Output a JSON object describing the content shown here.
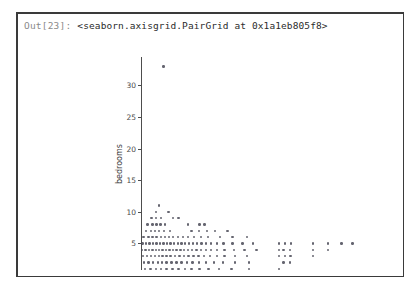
{
  "cell": {
    "prompt": "Out[23]:",
    "repr": "<seaborn.axisgrid.PairGrid at 0x1a1eb805f8>"
  },
  "chart_data": {
    "type": "scatter",
    "title": "",
    "xlabel": "",
    "ylabel": "bedrooms",
    "grid": false,
    "legend": null,
    "marker_color": "#4a4a57",
    "marker_size": 2.4,
    "xlim": [
      0,
      1.0
    ],
    "ylim": [
      0.8,
      34.5
    ],
    "yticks": [
      5,
      10,
      15,
      20,
      25,
      30
    ],
    "ytick_labels": [
      "5",
      "10",
      "15",
      "20",
      "25",
      "30"
    ],
    "xticks": [],
    "xtick_labels": [],
    "note": "x axis tick labels are cropped out of the visible figure region",
    "points": [
      [
        0.091,
        33
      ],
      [
        0.072,
        11
      ],
      [
        0.06,
        10
      ],
      [
        0.112,
        10
      ],
      [
        0.043,
        9
      ],
      [
        0.062,
        9
      ],
      [
        0.082,
        9
      ],
      [
        0.131,
        9
      ],
      [
        0.152,
        9
      ],
      [
        0.027,
        8
      ],
      [
        0.046,
        8
      ],
      [
        0.063,
        8
      ],
      [
        0.08,
        8
      ],
      [
        0.097,
        8
      ],
      [
        0.19,
        8
      ],
      [
        0.238,
        8
      ],
      [
        0.258,
        8
      ],
      [
        0.02,
        7
      ],
      [
        0.041,
        7
      ],
      [
        0.058,
        7
      ],
      [
        0.074,
        7
      ],
      [
        0.094,
        7
      ],
      [
        0.118,
        7
      ],
      [
        0.205,
        7
      ],
      [
        0.236,
        7
      ],
      [
        0.268,
        7
      ],
      [
        0.3,
        7
      ],
      [
        0.352,
        7
      ],
      [
        0.01,
        6
      ],
      [
        0.031,
        6
      ],
      [
        0.047,
        6
      ],
      [
        0.063,
        6
      ],
      [
        0.081,
        6
      ],
      [
        0.097,
        6
      ],
      [
        0.114,
        6
      ],
      [
        0.131,
        6
      ],
      [
        0.15,
        6
      ],
      [
        0.17,
        6
      ],
      [
        0.19,
        6
      ],
      [
        0.215,
        6
      ],
      [
        0.243,
        6
      ],
      [
        0.272,
        6
      ],
      [
        0.32,
        6
      ],
      [
        0.372,
        6
      ],
      [
        0.43,
        6
      ],
      [
        0.006,
        5
      ],
      [
        0.02,
        5
      ],
      [
        0.034,
        5
      ],
      [
        0.049,
        5
      ],
      [
        0.063,
        5
      ],
      [
        0.078,
        5
      ],
      [
        0.092,
        5
      ],
      [
        0.106,
        5
      ],
      [
        0.12,
        5
      ],
      [
        0.135,
        5
      ],
      [
        0.15,
        5
      ],
      [
        0.165,
        5
      ],
      [
        0.18,
        5
      ],
      [
        0.196,
        5
      ],
      [
        0.212,
        5
      ],
      [
        0.228,
        5
      ],
      [
        0.246,
        5
      ],
      [
        0.265,
        5
      ],
      [
        0.285,
        5
      ],
      [
        0.308,
        5
      ],
      [
        0.335,
        5
      ],
      [
        0.372,
        5
      ],
      [
        0.412,
        5
      ],
      [
        0.455,
        5
      ],
      [
        0.56,
        5
      ],
      [
        0.585,
        5
      ],
      [
        0.61,
        5
      ],
      [
        0.7,
        5
      ],
      [
        0.76,
        5
      ],
      [
        0.815,
        5
      ],
      [
        0.86,
        5
      ],
      [
        0.004,
        4
      ],
      [
        0.018,
        4
      ],
      [
        0.032,
        4
      ],
      [
        0.046,
        4
      ],
      [
        0.06,
        4
      ],
      [
        0.074,
        4
      ],
      [
        0.088,
        4
      ],
      [
        0.102,
        4
      ],
      [
        0.116,
        4
      ],
      [
        0.13,
        4
      ],
      [
        0.145,
        4
      ],
      [
        0.16,
        4
      ],
      [
        0.176,
        4
      ],
      [
        0.192,
        4
      ],
      [
        0.208,
        4
      ],
      [
        0.226,
        4
      ],
      [
        0.245,
        4
      ],
      [
        0.264,
        4
      ],
      [
        0.285,
        4
      ],
      [
        0.31,
        4
      ],
      [
        0.34,
        4
      ],
      [
        0.378,
        4
      ],
      [
        0.42,
        4
      ],
      [
        0.47,
        4
      ],
      [
        0.56,
        4
      ],
      [
        0.58,
        4
      ],
      [
        0.605,
        4
      ],
      [
        0.7,
        4
      ],
      [
        0.76,
        4
      ],
      [
        0.008,
        3
      ],
      [
        0.024,
        3
      ],
      [
        0.04,
        3
      ],
      [
        0.056,
        3
      ],
      [
        0.072,
        3
      ],
      [
        0.088,
        3
      ],
      [
        0.104,
        3
      ],
      [
        0.12,
        3
      ],
      [
        0.138,
        3
      ],
      [
        0.156,
        3
      ],
      [
        0.174,
        3
      ],
      [
        0.193,
        3
      ],
      [
        0.213,
        3
      ],
      [
        0.234,
        3
      ],
      [
        0.256,
        3
      ],
      [
        0.28,
        3
      ],
      [
        0.308,
        3
      ],
      [
        0.34,
        3
      ],
      [
        0.382,
        3
      ],
      [
        0.43,
        3
      ],
      [
        0.56,
        3
      ],
      [
        0.585,
        3
      ],
      [
        0.608,
        3
      ],
      [
        0.7,
        3
      ],
      [
        0.012,
        2
      ],
      [
        0.03,
        2
      ],
      [
        0.05,
        2
      ],
      [
        0.068,
        2
      ],
      [
        0.086,
        2
      ],
      [
        0.104,
        2
      ],
      [
        0.124,
        2
      ],
      [
        0.144,
        2
      ],
      [
        0.164,
        2
      ],
      [
        0.186,
        2
      ],
      [
        0.21,
        2
      ],
      [
        0.236,
        2
      ],
      [
        0.264,
        2
      ],
      [
        0.296,
        2
      ],
      [
        0.334,
        2
      ],
      [
        0.382,
        2
      ],
      [
        0.44,
        2
      ],
      [
        0.58,
        2
      ],
      [
        0.605,
        2
      ],
      [
        0.016,
        1
      ],
      [
        0.038,
        1
      ],
      [
        0.06,
        1
      ],
      [
        0.082,
        1
      ],
      [
        0.104,
        1
      ],
      [
        0.128,
        1
      ],
      [
        0.152,
        1
      ],
      [
        0.178,
        1
      ],
      [
        0.206,
        1
      ],
      [
        0.238,
        1
      ],
      [
        0.274,
        1
      ],
      [
        0.316,
        1
      ],
      [
        0.368,
        1
      ],
      [
        0.44,
        1
      ],
      [
        0.56,
        1
      ]
    ]
  }
}
